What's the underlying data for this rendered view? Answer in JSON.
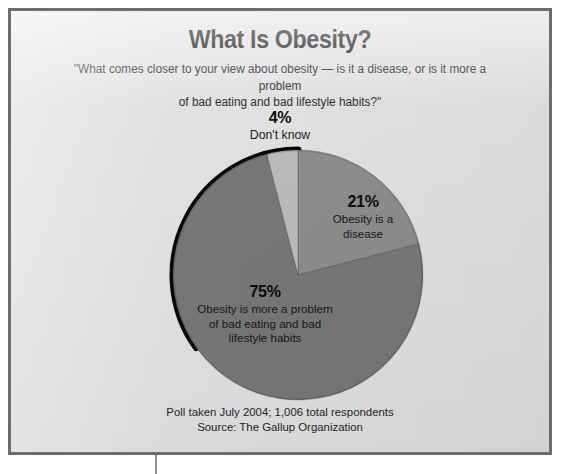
{
  "figure": {
    "title": "What Is Obesity?",
    "subtitle": "\"What comes closer to your view about obesity — is it a disease, or is it more a problem of bad eating and bad lifestyle habits?\"",
    "subtitle_line1": "\"What comes closer to your view about obesity — is it a disease, or is it more a problem",
    "subtitle_line2": "of bad eating and bad lifestyle habits?\"",
    "footer_line1": "Poll taken July 2004; 1,006 total respondents",
    "footer_line2": "Source: The Gallup Organization"
  },
  "callout_dont_know": {
    "percent": "4%",
    "label": "Don't know"
  },
  "labels": {
    "disease": {
      "percent": "21%",
      "line1": "Obesity is a",
      "line2": "disease"
    },
    "habits": {
      "percent": "75%",
      "line1": "Obesity is more a problem",
      "line2": "of bad eating and bad",
      "line3": "lifestyle habits"
    }
  },
  "chart_data": {
    "type": "pie",
    "title": "What Is Obesity?",
    "subtitle": "\"What comes closer to your view about obesity — is it a disease, or is it more a problem of bad eating and bad lifestyle habits?\"",
    "categories": [
      "Obesity is a disease",
      "Obesity is more a problem of bad eating and bad lifestyle habits",
      "Don't know"
    ],
    "values": [
      21,
      75,
      4
    ],
    "labels": [
      "21%",
      "75%",
      "4%"
    ],
    "units": "percent",
    "start_angle_deg": 0,
    "direction": "clockwise",
    "colors": [
      "#8e8e8e",
      "#787878",
      "#bdbdbd"
    ],
    "legend": "none",
    "grid": false,
    "source": "Source: The Gallup Organization",
    "note": "Poll taken July 2004; 1,006 total respondents"
  },
  "style": {
    "background": "#e2e2e2",
    "frame_border": "#6d6d6d",
    "slice_disease": "#8e8e8e",
    "slice_habits": "#787878",
    "slice_dont_know": "#bdbdbd",
    "pie_outline": "#070707",
    "text_color": "#161616"
  }
}
